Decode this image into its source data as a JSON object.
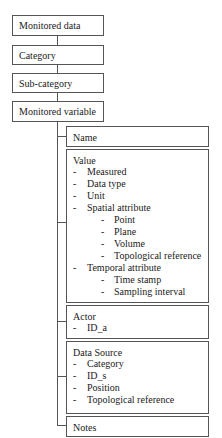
{
  "hierarchy": [
    {
      "label": "Monitored data"
    },
    {
      "label": "Category"
    },
    {
      "label": "Sub-category"
    },
    {
      "label": "Monitored variable"
    }
  ],
  "attributes": {
    "name": {
      "title": "Name"
    },
    "value": {
      "title": "Value",
      "items": [
        {
          "level": 1,
          "text": "Measured"
        },
        {
          "level": 1,
          "text": "Data type"
        },
        {
          "level": 1,
          "text": "Unit"
        },
        {
          "level": 1,
          "text": "Spatial attribute"
        },
        {
          "level": 2,
          "text": "Point"
        },
        {
          "level": 2,
          "text": "Plane"
        },
        {
          "level": 2,
          "text": "Volume"
        },
        {
          "level": 2,
          "text": "Topological reference"
        },
        {
          "level": 1,
          "text": "Temporal attribute"
        },
        {
          "level": 2,
          "text": "Time stamp"
        },
        {
          "level": 2,
          "text": "Sampling interval"
        }
      ]
    },
    "actor": {
      "title": "Actor",
      "items": [
        {
          "level": 1,
          "text": "ID_a"
        }
      ]
    },
    "data_source": {
      "title": "Data Source",
      "items": [
        {
          "level": 1,
          "text": "Category"
        },
        {
          "level": 1,
          "text": "ID_s"
        },
        {
          "level": 1,
          "text": "Position"
        },
        {
          "level": 1,
          "text": "Topological reference"
        }
      ]
    },
    "notes": {
      "title": "Notes"
    }
  },
  "bullet": "-"
}
